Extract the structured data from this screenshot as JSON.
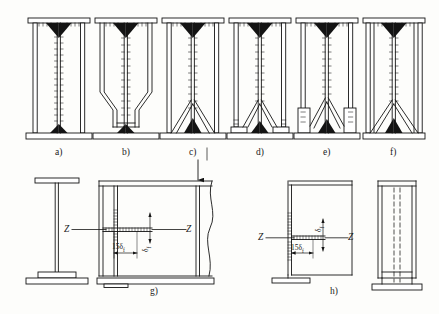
{
  "figure": {
    "type": "engineering-drawing",
    "stroke_color": "#141414",
    "fill_color": "#ffffff",
    "background": "#fdfdfb"
  },
  "top_row": {
    "caption_labels": [
      "a)",
      "b)",
      "c)",
      "d)",
      "e)",
      "f)"
    ],
    "items": [
      {
        "id": "a",
        "label": "a)",
        "description": "Plain column base: rectangular base plate, full-height web with stiffener ribs, top cap plate"
      },
      {
        "id": "b",
        "label": "b)",
        "description": "Column base with chamfered / tapered side plates narrowing toward the bottom flange"
      },
      {
        "id": "c",
        "label": "c)",
        "description": "Column base with diagonal gusset bracing at bottom, full side plates"
      },
      {
        "id": "d",
        "label": "d)",
        "description": "Column base with diagonal bracing and short side stiffener shoes on base plate"
      },
      {
        "id": "e",
        "label": "e)",
        "description": "Column base with raised side brackets and diagonal stiffeners"
      },
      {
        "id": "f",
        "label": "f)",
        "description": "Column base with full side plates and diagonal gussets forming a closed box"
      }
    ]
  },
  "bottom_row": {
    "caption_labels": [
      "g)",
      "h)"
    ],
    "g": {
      "label": "g)",
      "section_marks": [
        "Z",
        "Z"
      ],
      "dimension_horizontal": "15δ",
      "dimension_horizontal_sub": "f",
      "dimension_vertical": "δ",
      "dimension_vertical_sub": "f",
      "has_load_arrow": true,
      "has_break_line": true,
      "side_view_note": "I-section elevation with base plate"
    },
    "h": {
      "label": "h)",
      "section_marks": [
        "Z",
        "Z"
      ],
      "dimension_horizontal": "15δ",
      "dimension_horizontal_sub": "f",
      "dimension_vertical": "δ",
      "dimension_vertical_sub": "f",
      "has_break_line": false,
      "side_view_note": "Narrow side elevation with hidden (dashed) weld lines"
    }
  }
}
